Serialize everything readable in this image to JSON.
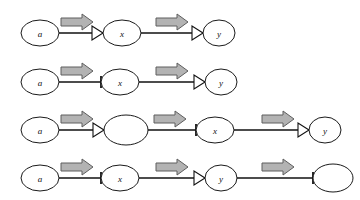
{
  "figure": {
    "width": 360,
    "height": 200,
    "background_color": "#ffffff",
    "node_fill_color": "#ffffff",
    "node_stroke_color": "#1a1a1a",
    "edge_color": "#111111",
    "block_arrow_fill_color": "#b3b3b3",
    "block_arrow_stroke_color": "#5e5e5e"
  },
  "rows": [
    {
      "id": "row-1",
      "y": 33,
      "nodes": [
        {
          "label": "a",
          "cx": 40,
          "rx": 19,
          "ry": 13
        },
        {
          "label": "x",
          "cx": 122,
          "rx": 19,
          "ry": 13
        },
        {
          "label": "y",
          "cx": 219,
          "rx": 16,
          "ry": 13
        }
      ],
      "edges": [
        {
          "from_x": 59,
          "to_x": 103,
          "end_marker": "arrowhead"
        },
        {
          "from_x": 141,
          "to_x": 203,
          "end_marker": "arrowhead"
        }
      ],
      "block_arrows": [
        {
          "cx": 77,
          "cy": 22
        },
        {
          "cx": 172,
          "cy": 22
        }
      ]
    },
    {
      "id": "row-2",
      "y": 82,
      "nodes": [
        {
          "label": "a",
          "cx": 40,
          "rx": 19,
          "ry": 13
        },
        {
          "label": "x",
          "cx": 120,
          "rx": 19,
          "ry": 13
        },
        {
          "label": "y",
          "cx": 221,
          "rx": 16,
          "ry": 13
        }
      ],
      "edges": [
        {
          "from_x": 59,
          "to_x": 101,
          "end_marker": "tick"
        },
        {
          "from_x": 139,
          "to_x": 205,
          "end_marker": "arrowhead"
        }
      ],
      "block_arrows": [
        {
          "cx": 77,
          "cy": 71
        },
        {
          "cx": 172,
          "cy": 71
        }
      ]
    },
    {
      "id": "row-3",
      "y": 130,
      "nodes": [
        {
          "label": "a",
          "cx": 40,
          "rx": 19,
          "ry": 13
        },
        {
          "label": "",
          "cx": 126,
          "rx": 22,
          "ry": 15
        },
        {
          "label": "x",
          "cx": 215,
          "rx": 19,
          "ry": 13
        },
        {
          "label": "y",
          "cx": 325,
          "rx": 16,
          "ry": 13
        }
      ],
      "edges": [
        {
          "from_x": 59,
          "to_x": 104,
          "end_marker": "arrowhead"
        },
        {
          "from_x": 148,
          "to_x": 196,
          "end_marker": "tick"
        },
        {
          "from_x": 234,
          "to_x": 309,
          "end_marker": "arrowhead"
        }
      ],
      "block_arrows": [
        {
          "cx": 77,
          "cy": 119
        },
        {
          "cx": 170,
          "cy": 119
        },
        {
          "cx": 278,
          "cy": 119
        }
      ]
    },
    {
      "id": "row-4",
      "y": 178,
      "nodes": [
        {
          "label": "a",
          "cx": 40,
          "rx": 19,
          "ry": 13
        },
        {
          "label": "x",
          "cx": 120,
          "rx": 19,
          "ry": 13
        },
        {
          "label": "y",
          "cx": 221,
          "rx": 16,
          "ry": 13
        },
        {
          "label": "",
          "cx": 333,
          "rx": 20,
          "ry": 14
        }
      ],
      "edges": [
        {
          "from_x": 59,
          "to_x": 101,
          "end_marker": "tick"
        },
        {
          "from_x": 139,
          "to_x": 205,
          "end_marker": "arrowhead"
        },
        {
          "from_x": 237,
          "to_x": 313,
          "end_marker": "tick"
        }
      ],
      "block_arrows": [
        {
          "cx": 77,
          "cy": 167
        },
        {
          "cx": 172,
          "cy": 167
        },
        {
          "cx": 278,
          "cy": 167
        }
      ]
    }
  ],
  "glyphs": {
    "block_arrow_name": "block-arrow-right-icon",
    "arrowhead_name": "edge-arrowhead-icon",
    "tick_name": "edge-tick-icon"
  }
}
